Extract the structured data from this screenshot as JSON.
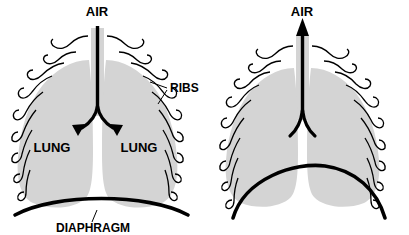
{
  "figure": {
    "title": "",
    "background_color": "#ffffff",
    "lung_fill_color": "#d4d4d4",
    "outline_color": "#000000",
    "panel_count": 2
  },
  "panels": [
    {
      "id": "inhalation",
      "name": "inhalation-panel",
      "phase": "inhalation",
      "air_label": "AIR",
      "air_flow_direction": "down",
      "diaphragm_state": "contracted-flattened",
      "bronchi_arrowheads": true,
      "labels": {
        "air": "AIR",
        "lung_left": "LUNG",
        "lung_right": "LUNG",
        "ribs": "RIBS",
        "diaphragm": "DIAPHRAGM"
      }
    },
    {
      "id": "exhalation",
      "name": "exhalation-panel",
      "phase": "exhalation",
      "air_label": "AIR",
      "air_flow_direction": "up",
      "diaphragm_state": "relaxed-domed",
      "bronchi_arrowheads": false,
      "labels": {
        "air": "AIR"
      }
    }
  ]
}
